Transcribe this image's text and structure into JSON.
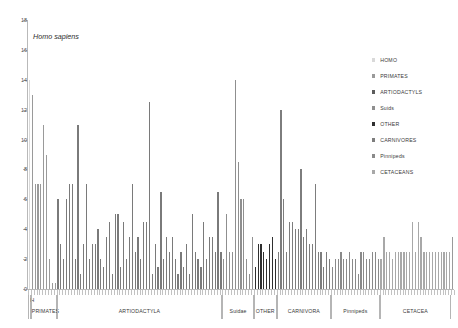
{
  "annotation": {
    "homo_sapiens": "Homo sapiens"
  },
  "legend": {
    "position": "right",
    "items": [
      {
        "label": "HOMO",
        "color": "#d9d9d9"
      },
      {
        "label": "PRIMATES",
        "color": "#9a9a9a"
      },
      {
        "label": "ARTIODACTYLS",
        "color": "#5c5c5c"
      },
      {
        "label": "Suids",
        "color": "#8f8f8f"
      },
      {
        "label": "OTHER",
        "color": "#2f2f2f"
      },
      {
        "label": "CARNIVORES",
        "color": "#7d7d7d"
      },
      {
        "label": "Pinnipeds",
        "color": "#8a8a8a"
      },
      {
        "label": "CETACEANS",
        "color": "#a8a8a8"
      }
    ]
  },
  "chart_data": {
    "type": "bar",
    "title": "",
    "subtitle": "",
    "xlabel": "",
    "ylabel": "",
    "ylim": [
      0,
      18
    ],
    "ytick_labels": [
      "0",
      "2",
      "4",
      "6",
      "8",
      "10",
      "12",
      "14",
      "16",
      "18"
    ],
    "ytick_values": [
      0,
      2,
      4,
      6,
      8,
      10,
      12,
      14,
      16,
      18
    ],
    "grid": false,
    "xtick_labels_shown": false,
    "groups": [
      {
        "label": "H",
        "start": 0,
        "count": 1,
        "color": "#d9d9d9",
        "label_position": "top"
      },
      {
        "label": "PRIMATES",
        "start": 1,
        "count": 9,
        "color": "#9a9a9a",
        "label_position": "bottom"
      },
      {
        "label": "ARTIODACTYLA",
        "start": 10,
        "count": 58,
        "color": "#7a7a7a",
        "label_position": "bottom"
      },
      {
        "label": "Suidae",
        "start": 68,
        "count": 11,
        "color": "#8f8f8f",
        "label_position": "bottom"
      },
      {
        "label": "OTHER",
        "start": 79,
        "count": 8,
        "color": "#2f2f2f",
        "label_position": "bottom"
      },
      {
        "label": "CARNIVORA",
        "start": 87,
        "count": 19,
        "color": "#7d7d7d",
        "label_position": "bottom"
      },
      {
        "label": "Pinnipeds",
        "start": 106,
        "count": 17,
        "color": "#8a8a8a",
        "label_position": "bottom"
      },
      {
        "label": "CETACEA",
        "start": 123,
        "count": 25,
        "color": "#a8a8a8",
        "label_position": "bottom"
      }
    ],
    "values": [
      14,
      13,
      7,
      7,
      7,
      11,
      9,
      2,
      0.4,
      0.4,
      6,
      3,
      2,
      6,
      7,
      7,
      2,
      11,
      1,
      3,
      7,
      2,
      3,
      3,
      4,
      2,
      1.5,
      3.5,
      4.5,
      1,
      5,
      5,
      1.5,
      4.5,
      2,
      3.5,
      7,
      2.5,
      3.5,
      2,
      4.5,
      4.5,
      12.5,
      1,
      3,
      1.5,
      6.5,
      2,
      3.5,
      2.5,
      3.5,
      2,
      1,
      2.5,
      1.5,
      3,
      1,
      5,
      2.5,
      2,
      1.5,
      4.5,
      2,
      3.5,
      3.5,
      2.5,
      6.5,
      2.5,
      2,
      5,
      2.5,
      2.5,
      14,
      8.5,
      6,
      6,
      2,
      1,
      3.5,
      1.5,
      3,
      3,
      2.5,
      2,
      3,
      3.5,
      2,
      2.5,
      12,
      6,
      2.5,
      4.5,
      4.5,
      4,
      4,
      8,
      3.5,
      4,
      3,
      3,
      7,
      2.5,
      2.5,
      1.5,
      2.5,
      2,
      1.5,
      2,
      2,
      2.5,
      2,
      2,
      2.5,
      2,
      2,
      1,
      2.5,
      2.5,
      2,
      2,
      2.5,
      2.5,
      2,
      2,
      3.5,
      2.5,
      2.5,
      2,
      2.5,
      2.5,
      2.5,
      2.5,
      2.5,
      2.5,
      4.5,
      2.5,
      4.5,
      3.5,
      2.5,
      2.5,
      2.5,
      2.5,
      2.5,
      2.5,
      2.5,
      2.5,
      2.5,
      2.5,
      3.5
    ]
  }
}
